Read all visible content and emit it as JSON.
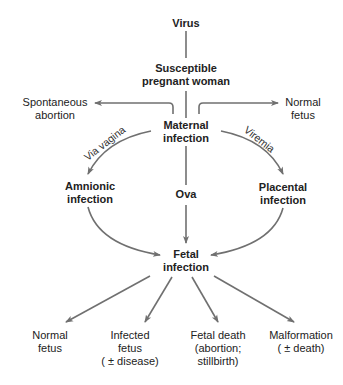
{
  "diagram": {
    "type": "flowchart",
    "line_color": "#707070",
    "text_color": "#222222",
    "nodes": {
      "virus": {
        "lines": [
          "Virus"
        ]
      },
      "susceptible": {
        "lines": [
          "Susceptible",
          "pregnant woman"
        ]
      },
      "spontaneous_abortion": {
        "lines": [
          "Spontaneous",
          "abortion"
        ]
      },
      "normal_fetus_top": {
        "lines": [
          "Normal",
          "fetus"
        ]
      },
      "maternal_infection": {
        "lines": [
          "Maternal",
          "infection"
        ]
      },
      "amnionic_infection": {
        "lines": [
          "Amnionic",
          "infection"
        ]
      },
      "ova": {
        "lines": [
          "Ova"
        ]
      },
      "placental_infection": {
        "lines": [
          "Placental",
          "infection"
        ]
      },
      "fetal_infection": {
        "lines": [
          "Fetal",
          "infection"
        ]
      },
      "normal_fetus_bottom": {
        "lines": [
          "Normal",
          "fetus"
        ]
      },
      "infected_fetus": {
        "lines": [
          "Infected",
          "fetus",
          "( ± disease)"
        ]
      },
      "fetal_death": {
        "lines": [
          "Fetal death",
          "(abortion;",
          "stillbirth)"
        ]
      },
      "malformation": {
        "lines": [
          "Malformation",
          "( ± death)"
        ]
      }
    },
    "edge_labels": {
      "via_vagina": "Via vagina",
      "viremia": "Viremia"
    },
    "edges": [
      {
        "from": "Virus",
        "to": "Susceptible pregnant woman"
      },
      {
        "from": "Susceptible pregnant woman",
        "to": "Maternal infection"
      },
      {
        "from": "Maternal infection",
        "to": "Spontaneous abortion"
      },
      {
        "from": "Maternal infection",
        "to": "Normal fetus"
      },
      {
        "from": "Maternal infection",
        "to": "Amnionic infection",
        "label": "Via vagina"
      },
      {
        "from": "Maternal infection",
        "to": "Placental infection",
        "label": "Viremia"
      },
      {
        "from": "Maternal infection",
        "to": "Fetal infection",
        "via": "Ova"
      },
      {
        "from": "Amnionic infection",
        "to": "Fetal infection"
      },
      {
        "from": "Placental infection",
        "to": "Fetal infection"
      },
      {
        "from": "Fetal infection",
        "to": "Normal fetus"
      },
      {
        "from": "Fetal infection",
        "to": "Infected fetus (± disease)"
      },
      {
        "from": "Fetal infection",
        "to": "Fetal death (abortion; stillbirth)"
      },
      {
        "from": "Fetal infection",
        "to": "Malformation (± death)"
      }
    ]
  }
}
